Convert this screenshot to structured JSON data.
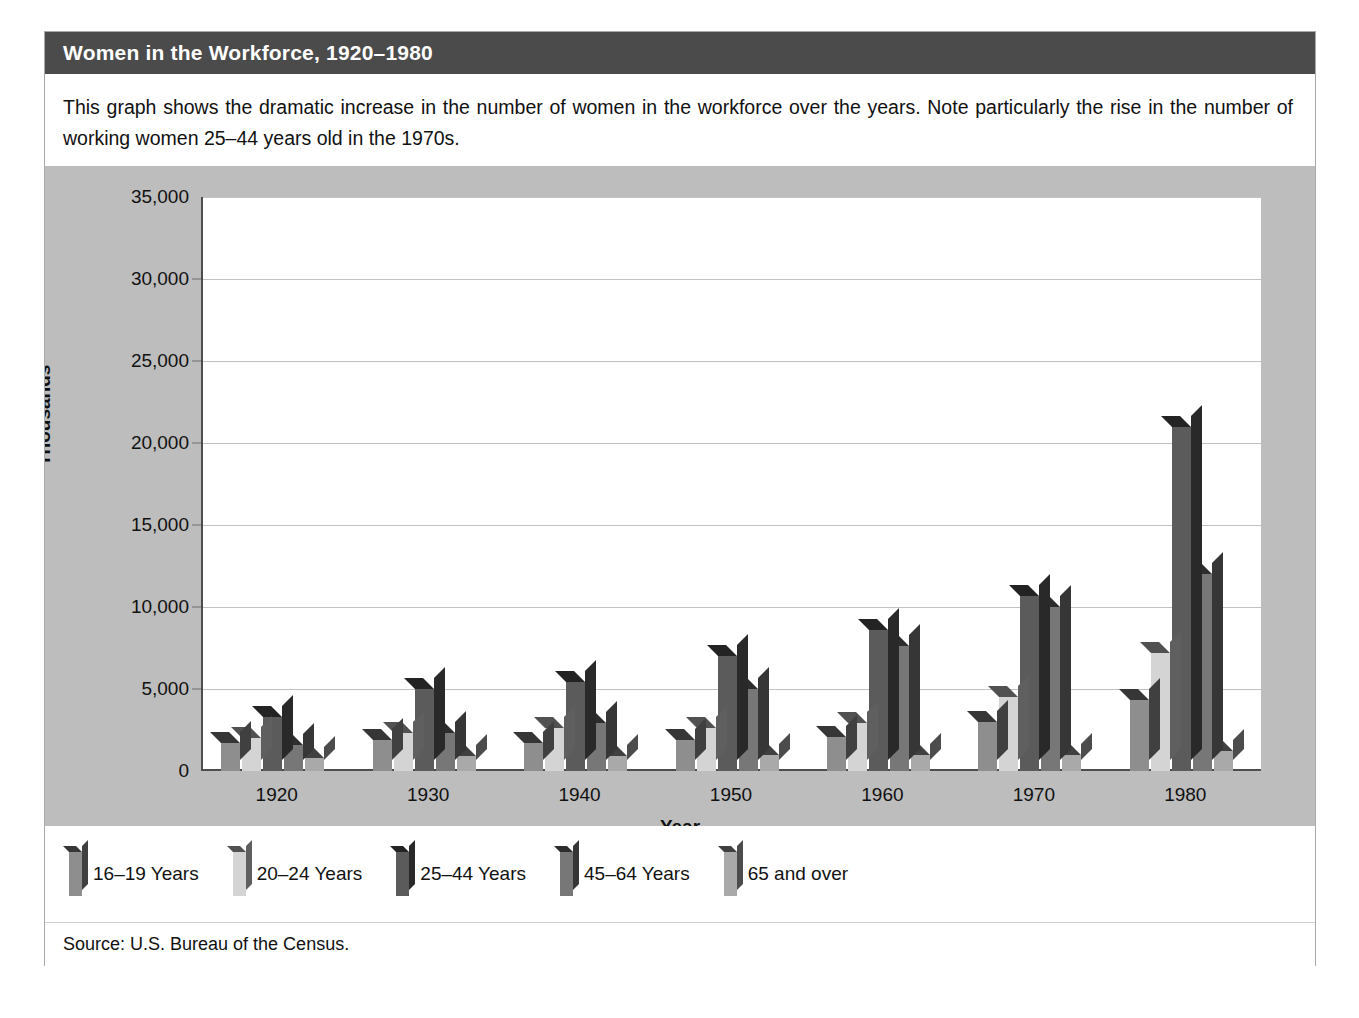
{
  "header": {
    "title": "Women in the Workforce, 1920–1980"
  },
  "caption": {
    "text": "This graph shows the dramatic increase in the number of women in the workforce over the years. Note particularly the rise in the number of working women 25–44 years old in the 1970s."
  },
  "source": {
    "text": "Source: U.S. Bureau of the Census."
  },
  "colors": {
    "header_bg": "#4b4b4b",
    "panel_bg": "#bdbdbd",
    "plot_bg": "#ffffff",
    "gridline": "#c2c2c2",
    "axis": "#4d4d4d",
    "series": [
      "#8e8e8e",
      "#d4d4d4",
      "#5b5b5b",
      "#777777",
      "#a9a9a9"
    ]
  },
  "chart_data": {
    "type": "bar",
    "title": "Women in the Workforce, 1920–1980",
    "xlabel": "Year",
    "ylabel": "Thousands",
    "ylim": [
      0,
      35000
    ],
    "yticks": [
      0,
      5000,
      10000,
      15000,
      20000,
      25000,
      30000,
      35000
    ],
    "ytick_labels": [
      "0",
      "5,000",
      "10,000",
      "15,000",
      "20,000",
      "25,000",
      "30,000",
      "35,000"
    ],
    "grid": true,
    "legend_position": "bottom",
    "categories": [
      "1920",
      "1930",
      "1940",
      "1950",
      "1960",
      "1970",
      "1980"
    ],
    "series": [
      {
        "name": "16–19 Years",
        "color": "#8e8e8e",
        "values": [
          1700,
          1900,
          1700,
          1900,
          2100,
          3000,
          4300
        ]
      },
      {
        "name": "20–24 Years",
        "color": "#d4d4d4",
        "values": [
          2000,
          2300,
          2600,
          2600,
          2900,
          4500,
          7200
        ]
      },
      {
        "name": "25–44 Years",
        "color": "#5b5b5b",
        "values": [
          3300,
          5000,
          5400,
          7000,
          8600,
          10700,
          21000
        ]
      },
      {
        "name": "45–64 Years",
        "color": "#777777",
        "values": [
          1600,
          2300,
          2900,
          5000,
          7600,
          10000,
          12000
        ]
      },
      {
        "name": "65 and over",
        "color": "#a9a9a9",
        "values": [
          800,
          900,
          900,
          1000,
          1000,
          1000,
          1200
        ]
      }
    ]
  }
}
